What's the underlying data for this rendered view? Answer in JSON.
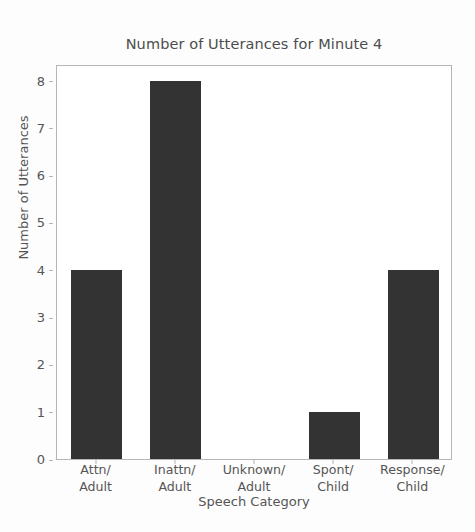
{
  "chart_data": {
    "type": "bar",
    "title": "Number of Utterances for Minute 4",
    "xlabel": "Speech Category",
    "ylabel": "Number of Utterances",
    "categories": [
      "Attn/\nAdult",
      "Inattn/\nAdult",
      "Unknown/\nAdult",
      "Spont/\nChild",
      "Response/\nChild"
    ],
    "category_lines": [
      [
        "Attn/",
        "Adult"
      ],
      [
        "Inattn/",
        "Adult"
      ],
      [
        "Unknown/",
        "Adult"
      ],
      [
        "Spont/",
        "Child"
      ],
      [
        "Response/",
        "Child"
      ]
    ],
    "values": [
      4,
      8,
      0,
      1,
      4
    ],
    "ylim": [
      0,
      8.35
    ],
    "yticks": [
      0,
      1,
      2,
      3,
      4,
      5,
      6,
      7,
      8
    ],
    "ytick_labels": [
      "0",
      "1",
      "2",
      "3",
      "4",
      "5",
      "6",
      "7",
      "8"
    ],
    "grid": false,
    "legend": null,
    "bar_color": "#333333",
    "axis_color": "#b6b6b6",
    "text_color": "#555555",
    "background_color": "#ffffff"
  }
}
